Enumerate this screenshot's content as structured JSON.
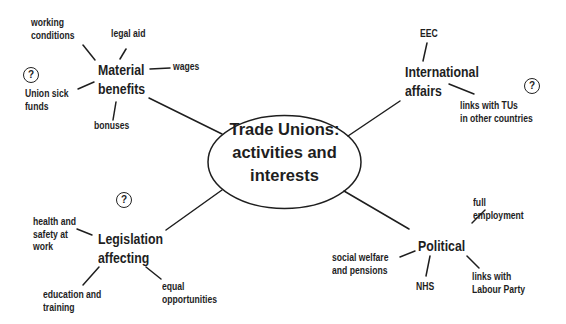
{
  "center": {
    "title": "Trade Unions:\nactivities and\ninterests",
    "shape": "ellipse"
  },
  "branches": [
    {
      "id": "material",
      "label": "Material\nbenefits",
      "question_mark": true,
      "children": [
        "working\nconditions",
        "legal aid",
        "wages",
        "Union sick\nfunds",
        "bonuses"
      ]
    },
    {
      "id": "international",
      "label": "International\naffairs",
      "question_mark": true,
      "children": [
        "EEC",
        "links with TUs\nin other countries"
      ]
    },
    {
      "id": "legislation",
      "label": "Legislation\naffecting",
      "question_mark": true,
      "children": [
        "health and\nsafety at\nwork",
        "education and\ntraining",
        "equal\nopportunities"
      ]
    },
    {
      "id": "political",
      "label": "Political",
      "question_mark": false,
      "children": [
        "full\nemployment",
        "social welfare\nand pensions",
        "NHS",
        "links with\nLabour Party"
      ]
    }
  ],
  "question_icon": "?",
  "colors": {
    "ink": "#1e1e1e",
    "background": "#ffffff"
  }
}
